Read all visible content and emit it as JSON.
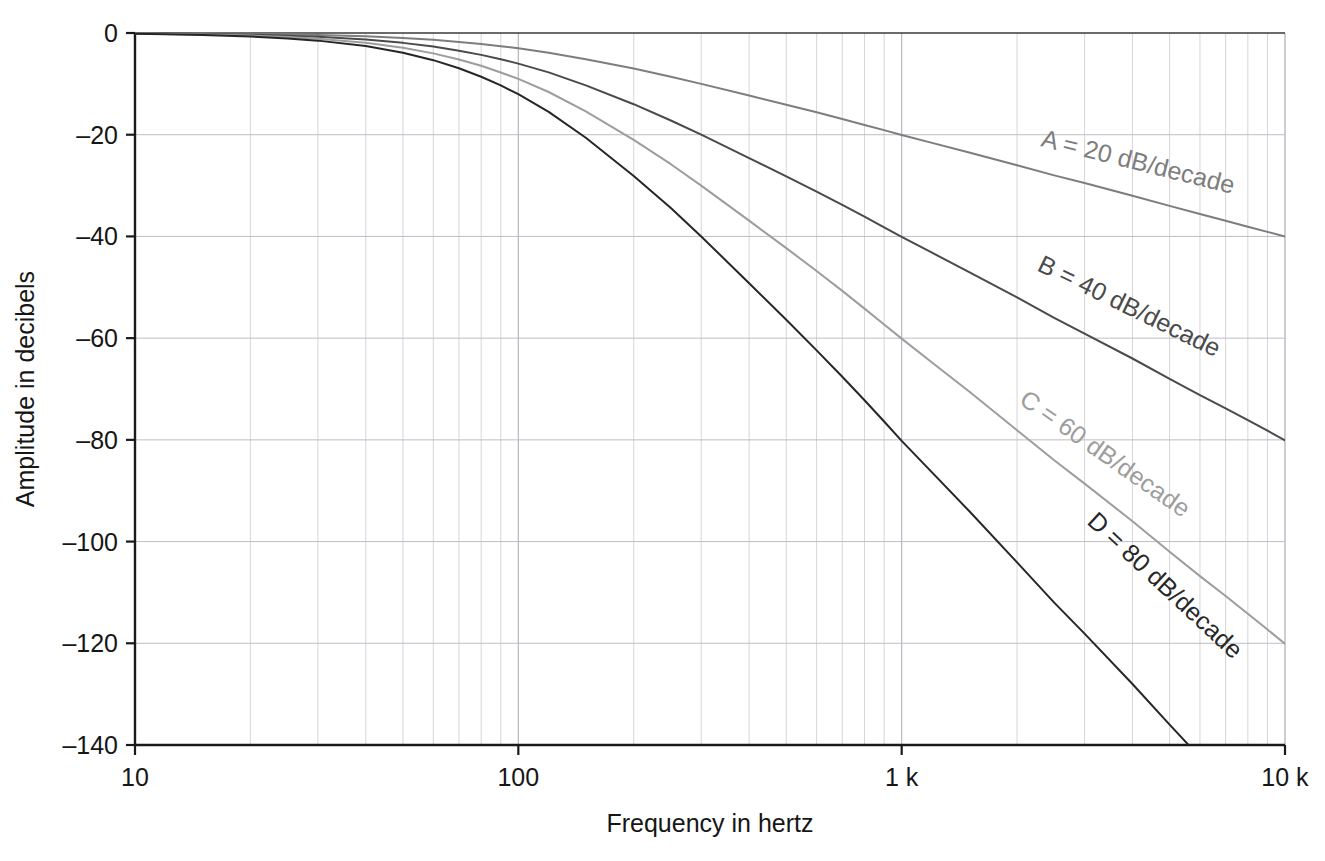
{
  "chart_data": {
    "type": "line",
    "title": "",
    "xlabel": "Frequency in hertz",
    "ylabel": "Amplitude in decibels",
    "xscale": "log",
    "xlim": [
      10,
      10000
    ],
    "ylim": [
      -140,
      0
    ],
    "grid": true,
    "legend_position": "inline-on-curves",
    "x_tick_labels": [
      "10",
      "100",
      "1 k",
      "10 k"
    ],
    "x_tick_values": [
      10,
      100,
      1000,
      10000
    ],
    "y_tick_labels": [
      "0",
      "–20",
      "–40",
      "–60",
      "–80",
      "–100",
      "–120",
      "–140"
    ],
    "y_tick_values": [
      0,
      -20,
      -40,
      -60,
      -80,
      -100,
      -120,
      -140
    ],
    "x": [
      10,
      12,
      15,
      20,
      25,
      30,
      40,
      50,
      60,
      70,
      80,
      90,
      100,
      120,
      150,
      200,
      250,
      300,
      400,
      500,
      600,
      700,
      800,
      900,
      1000,
      1200,
      1500,
      2000,
      2500,
      3000,
      4000,
      5000,
      6000,
      7000,
      8000,
      9000,
      10000
    ],
    "series": [
      {
        "name": "A",
        "label": "A = 20 dB/decade",
        "slope_db_per_decade": 20,
        "order": 1,
        "cutoff_hz": 100,
        "color": "#7d7d7d",
        "label_x": 1040,
        "label_y": 146,
        "label_rotation": 14,
        "values": [
          -0.04,
          -0.06,
          -0.1,
          -0.17,
          -0.26,
          -0.37,
          -0.64,
          -0.97,
          -1.34,
          -1.75,
          -2.15,
          -2.6,
          -3.01,
          -3.87,
          -5.15,
          -7.0,
          -8.6,
          -10.0,
          -12.3,
          -14.1,
          -15.6,
          -16.9,
          -18.1,
          -19.1,
          -20.04,
          -21.6,
          -23.5,
          -26.0,
          -28.0,
          -29.5,
          -32.0,
          -34.0,
          -35.6,
          -36.9,
          -38.1,
          -39.1,
          -40.04
        ]
      },
      {
        "name": "B",
        "label": "B = 40 dB/decade",
        "slope_db_per_decade": 40,
        "order": 2,
        "cutoff_hz": 100,
        "color": "#4a4a4a",
        "label_x": 1036,
        "label_y": 270,
        "label_rotation": 26,
        "values": [
          -0.08,
          -0.12,
          -0.19,
          -0.34,
          -0.53,
          -0.75,
          -1.29,
          -1.94,
          -2.67,
          -3.47,
          -4.3,
          -5.17,
          -6.02,
          -7.74,
          -10.3,
          -14.0,
          -17.2,
          -20.0,
          -24.6,
          -28.2,
          -31.2,
          -33.8,
          -36.1,
          -38.2,
          -40.09,
          -43.2,
          -47.0,
          -52.0,
          -56.0,
          -59.1,
          -64.0,
          -68.0,
          -71.2,
          -73.8,
          -76.1,
          -78.2,
          -80.09
        ]
      },
      {
        "name": "C",
        "label": "C = 60 dB/decade",
        "slope_db_per_decade": 60,
        "order": 3,
        "cutoff_hz": 100,
        "color": "#9d9d9d",
        "label_x": 1018,
        "label_y": 403,
        "label_rotation": 35,
        "values": [
          -0.12,
          -0.19,
          -0.29,
          -0.51,
          -0.79,
          -1.12,
          -1.93,
          -2.91,
          -4.01,
          -5.21,
          -6.45,
          -7.76,
          -9.03,
          -11.6,
          -15.4,
          -21.0,
          -25.8,
          -30.0,
          -36.9,
          -42.3,
          -46.8,
          -50.7,
          -54.2,
          -57.3,
          -60.1,
          -64.8,
          -70.5,
          -78.1,
          -84.0,
          -88.6,
          -96.0,
          -102.0,
          -106.8,
          -110.7,
          -114.2,
          -117.3,
          -120.1
        ]
      },
      {
        "name": "D",
        "label": "D = 80 dB/decade",
        "slope_db_per_decade": 80,
        "order": 4,
        "cutoff_hz": 100,
        "color": "#262626",
        "label_x": 1086,
        "label_y": 523,
        "label_rotation": 43,
        "values": [
          -0.16,
          -0.25,
          -0.39,
          -0.68,
          -1.06,
          -1.5,
          -2.57,
          -3.88,
          -5.34,
          -6.94,
          -8.6,
          -10.3,
          -12.04,
          -15.5,
          -20.6,
          -28.1,
          -34.4,
          -40.0,
          -49.2,
          -56.4,
          -62.4,
          -67.6,
          -72.2,
          -76.4,
          -80.2,
          -86.4,
          -94.0,
          -104.1,
          -112.0,
          -118.1,
          -128.0,
          -136.0,
          -142.4,
          -147.6,
          -152.2,
          -156.4,
          -160.2
        ]
      }
    ]
  },
  "plot": {
    "left_px": 135,
    "right_px": 1285,
    "top_px": 33,
    "bottom_px": 745,
    "axis_color": "#1a1a1a",
    "grid_color": "#b9b9c3",
    "background": "#ffffff"
  }
}
